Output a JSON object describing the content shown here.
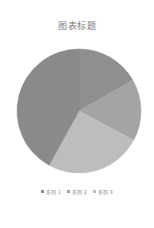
{
  "chart_data": {
    "type": "pie",
    "title": "图表标题",
    "categories": [
      "系列 1",
      "系列 2",
      "系列 3"
    ],
    "slices": [
      {
        "label": "系列 1",
        "start_deg": 0,
        "end_deg": 60,
        "color": "#8f8f8f"
      },
      {
        "label": "系列 2",
        "start_deg": 60,
        "end_deg": 118,
        "color": "#a4a4a4"
      },
      {
        "label": "系列 3",
        "start_deg": 118,
        "end_deg": 209,
        "color": "#bdbdbd"
      },
      {
        "label": "",
        "start_deg": 209,
        "end_deg": 360,
        "color": "#8a8a8a"
      }
    ],
    "values_percent": [
      16.7,
      16.1,
      25.3,
      41.9
    ],
    "legend": {
      "position": "bottom",
      "entries": [
        "系列 1",
        "系列 2",
        "系列 3"
      ]
    },
    "center": [
      79,
      111
    ],
    "radius": 62
  },
  "legend": [
    {
      "label": "系列 1",
      "color": "#8f8f8f"
    },
    {
      "label": "系列 2",
      "color": "#a4a4a4"
    },
    {
      "label": "系列 3",
      "color": "#bdbdbd"
    }
  ]
}
